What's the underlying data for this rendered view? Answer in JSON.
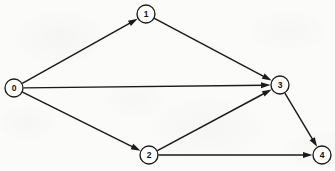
{
  "figure": {
    "type": "directed-graph",
    "canvas": {
      "width": 335,
      "height": 171
    },
    "background_color": "#fbfbf9",
    "stroke_color": "#1a1a1a",
    "node_fill_color": "#ffffff",
    "node_radius": 9
  },
  "nodes": [
    {
      "id": "0",
      "label": "0",
      "x": 14,
      "y": 88
    },
    {
      "id": "1",
      "label": "1",
      "x": 146,
      "y": 14
    },
    {
      "id": "2",
      "label": "2",
      "x": 149,
      "y": 155
    },
    {
      "id": "3",
      "label": "3",
      "x": 280,
      "y": 85
    },
    {
      "id": "4",
      "label": "4",
      "x": 322,
      "y": 155
    }
  ],
  "edges": [
    {
      "from": "0",
      "to": "1",
      "directed": true
    },
    {
      "from": "0",
      "to": "3",
      "directed": true
    },
    {
      "from": "0",
      "to": "2",
      "directed": true
    },
    {
      "from": "1",
      "to": "3",
      "directed": true
    },
    {
      "from": "2",
      "to": "3",
      "directed": true
    },
    {
      "from": "2",
      "to": "4",
      "directed": true
    },
    {
      "from": "3",
      "to": "4",
      "directed": true
    }
  ],
  "arrow": {
    "length": 9.5,
    "half_width": 3.0
  }
}
